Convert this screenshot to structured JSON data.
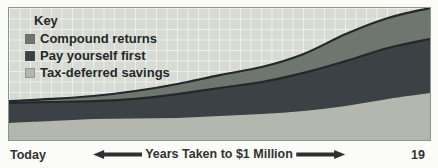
{
  "page": {
    "background": "#fbfbf8",
    "page_number": "19"
  },
  "legend": {
    "title": "Key",
    "items": [
      {
        "label": "Compound returns",
        "color": "#6f756f"
      },
      {
        "label": "Pay yourself first",
        "color": "#3c4145"
      },
      {
        "label": "Tax-deferred savings",
        "color": "#b3b7ae"
      }
    ]
  },
  "axis": {
    "left_label": "Today",
    "center_label": "Years Taken to $1 Million",
    "arrow_color": "#2c3033"
  },
  "chart_data": {
    "type": "area",
    "stacked": true,
    "title": "",
    "xlabel": "Years Taken to $1 Million",
    "ylabel": "",
    "x_start_label": "Today",
    "plot_bg": "#d8dbd3",
    "grid": {
      "show": true,
      "cell_px": 10.5,
      "line_color": "rgba(255,255,255,0.55)"
    },
    "x_normalized": [
      0,
      0.1,
      0.2,
      0.3,
      0.4,
      0.5,
      0.6,
      0.7,
      0.8,
      0.9,
      1.0
    ],
    "series": [
      {
        "name": "Tax-deferred savings",
        "color": "#b3b7ae",
        "stack_top_normalized": [
          0.129,
          0.144,
          0.159,
          0.163,
          0.167,
          0.182,
          0.197,
          0.22,
          0.258,
          0.311,
          0.356
        ]
      },
      {
        "name": "Pay yourself first",
        "color": "#3c4145",
        "edge_stroke": "#24282b",
        "stack_top_normalized": [
          0.28,
          0.288,
          0.295,
          0.311,
          0.348,
          0.394,
          0.439,
          0.508,
          0.598,
          0.697,
          0.765
        ]
      },
      {
        "name": "Compound returns",
        "color": "#6f756f",
        "edge_stroke": "#24282b",
        "stack_top_normalized": [
          0.295,
          0.311,
          0.333,
          0.371,
          0.424,
          0.492,
          0.553,
          0.652,
          0.803,
          0.924,
          1.0
        ]
      }
    ]
  }
}
